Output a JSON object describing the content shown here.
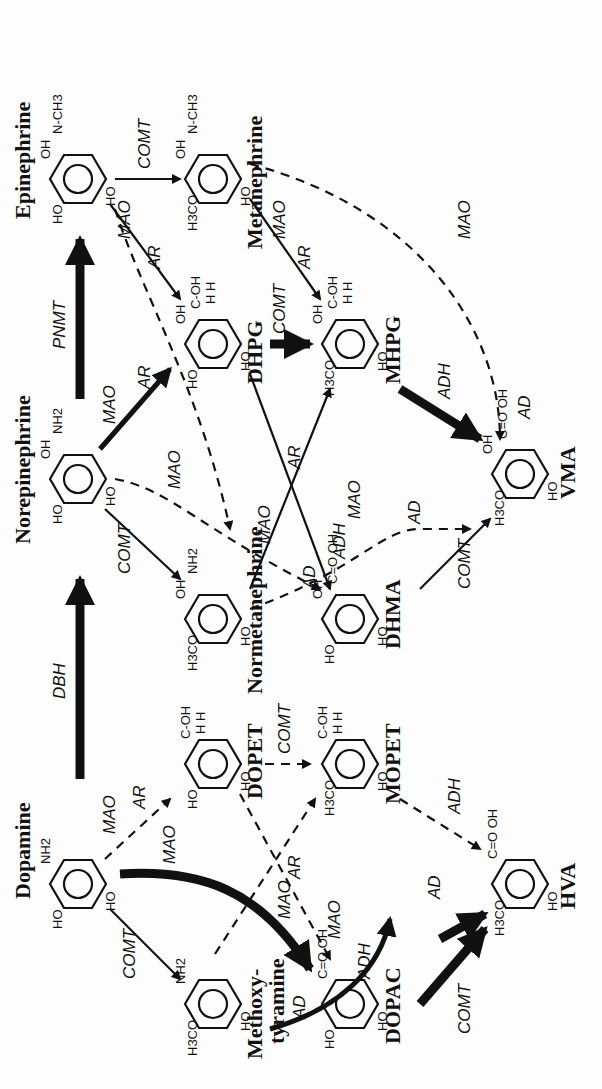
{
  "compounds": {
    "dopamine": "Dopamine",
    "norepinephrine": "Norepinephrine",
    "epinephrine": "Epinephrine",
    "metanephrine": "Metanephrine",
    "dhpg": "DHPG",
    "mhpg": "MHPG",
    "vma": "VMA",
    "normetanephrine": "Normetanephrine",
    "dhma": "DHMA",
    "dopet": "DOPET",
    "mopet": "MOPET",
    "methoxytyramine_1": "Methoxy-",
    "methoxytyramine_2": "tyramine",
    "dopac": "DOPAC",
    "hva": "HVA"
  },
  "enzymes": {
    "dbh": "DBH",
    "pnmt": "PNMT",
    "comt": "COMT",
    "mao": "MAO",
    "ar": "AR",
    "ad": "AD",
    "adh": "ADH"
  },
  "atoms": {
    "ho": "HO",
    "oh": "OH",
    "h3co": "H3CO",
    "nh2": "NH2",
    "nhch3": "N-CH3",
    "h": "H",
    "choh": "C-OH",
    "hh": "H H",
    "cooh": "C=O OH"
  },
  "reactions": [
    {
      "from": "Dopamine",
      "to": "Norepinephrine",
      "enzyme": "DBH",
      "style": "heavy"
    },
    {
      "from": "Norepinephrine",
      "to": "Epinephrine",
      "enzyme": "PNMT",
      "style": "heavy"
    },
    {
      "from": "Epinephrine",
      "to": "Metanephrine",
      "enzyme": "COMT",
      "style": "solid"
    },
    {
      "from": "Epinephrine",
      "to": "DHPG",
      "enzyme": "MAO/AR",
      "style": "solid"
    },
    {
      "from": "Norepinephrine",
      "to": "DHPG",
      "enzyme": "MAO/AR",
      "style": "heavy"
    },
    {
      "from": "Norepinephrine",
      "to": "Normetanephrine",
      "enzyme": "COMT",
      "style": "solid"
    },
    {
      "from": "Norepinephrine",
      "to": "DHMA",
      "enzyme": "MAO/AD",
      "style": "dashed"
    },
    {
      "from": "DHPG",
      "to": "MHPG",
      "enzyme": "COMT",
      "style": "heavy"
    },
    {
      "from": "DHPG",
      "to": "DHMA",
      "enzyme": "ADH",
      "style": "solid"
    },
    {
      "from": "Metanephrine",
      "to": "MHPG",
      "enzyme": "MAO/AR",
      "style": "solid"
    },
    {
      "from": "Metanephrine",
      "to": "VMA",
      "enzyme": "MAO/AD",
      "style": "dashed"
    },
    {
      "from": "Normetanephrine",
      "to": "MHPG",
      "enzyme": "MAO/AR",
      "style": "solid"
    },
    {
      "from": "Normetanephrine",
      "to": "VMA",
      "enzyme": "MAO/AD",
      "style": "dashed"
    },
    {
      "from": "MHPG",
      "to": "VMA",
      "enzyme": "ADH",
      "style": "heavy"
    },
    {
      "from": "DHMA",
      "to": "VMA",
      "enzyme": "COMT",
      "style": "solid"
    },
    {
      "from": "Dopamine",
      "to": "Methoxytyramine",
      "enzyme": "COMT",
      "style": "solid"
    },
    {
      "from": "Dopamine",
      "to": "DOPAC",
      "enzyme": "MAO/AD",
      "style": "heavy"
    },
    {
      "from": "Dopamine",
      "to": "DOPET",
      "enzyme": "MAO/AR",
      "style": "dashed"
    },
    {
      "from": "DOPET",
      "to": "MOPET",
      "enzyme": "COMT",
      "style": "dashed"
    },
    {
      "from": "MOPET",
      "to": "HVA",
      "enzyme": "ADH",
      "style": "dashed"
    },
    {
      "from": "Methoxytyramine",
      "to": "HVA",
      "enzyme": "MAO/AD",
      "style": "heavy"
    },
    {
      "from": "DOPAC",
      "to": "HVA",
      "enzyme": "COMT",
      "style": "heavy"
    },
    {
      "from": "DOPET",
      "to": "DOPAC",
      "enzyme": "ADH",
      "style": "dashed"
    }
  ]
}
